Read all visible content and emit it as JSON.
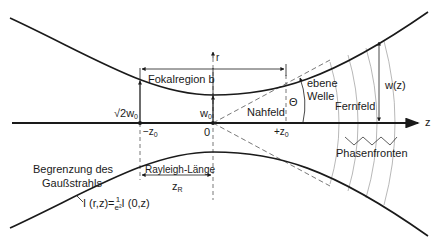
{
  "diagram": {
    "title": "Gaußstrahl",
    "labels": {
      "r_axis": "r",
      "z_axis": "z",
      "focal_region": "Fokalregion b",
      "sqrt2w0": "√2w",
      "sqrt2w0_sub": "0",
      "w0": "w",
      "w0_sub": "0",
      "minus_z0": "−z",
      "minus_z0_sub": "0",
      "origin": "0",
      "plus_z0": "+z",
      "plus_z0_sub": "0",
      "near_field": "Nahfeld",
      "plane_wave_line1": "ebene",
      "plane_wave_line2": "Welle",
      "theta": "Θ",
      "far_field": "Fernfeld",
      "beam_width": "w(z)",
      "phase_fronts": "Phasenfronten",
      "rayleigh_length": "Rayleigh-Länge",
      "zR": "z",
      "zR_sub": "R",
      "boundary_line1": "Begrenzung des",
      "boundary_line2": "Gaußstrahls",
      "intensity_formula_left": "I (r,z)=",
      "intensity_formula_num": "1",
      "intensity_formula_den": "e²",
      "intensity_formula_right": "I (0,z)"
    },
    "colors": {
      "line": "#1a1a1a",
      "dashed": "#555555",
      "phase_front": "#999999"
    }
  }
}
